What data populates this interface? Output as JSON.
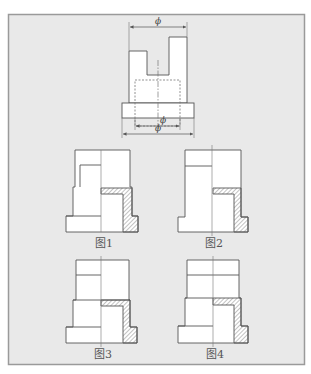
{
  "diagram": {
    "type": "engineering-drawing",
    "colors": {
      "page_bg": "#ffffff",
      "frame_bg": "#e9e9e9",
      "frame_border": "#9a9a9a",
      "part_fill": "#ffffff",
      "line": "#555555",
      "hidden_line": "#777777",
      "hatch": "#666666"
    },
    "main_view": {
      "dimension_symbols": [
        "ϕ",
        "ϕ",
        "ϕ"
      ]
    },
    "options": [
      {
        "label": "图1"
      },
      {
        "label": "图2"
      },
      {
        "label": "图3"
      },
      {
        "label": "图4"
      }
    ]
  }
}
